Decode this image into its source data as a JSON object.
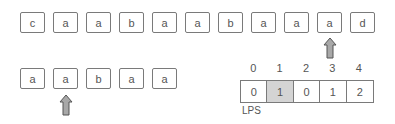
{
  "text": {
    "chars": [
      "c",
      "a",
      "a",
      "b",
      "a",
      "a",
      "b",
      "a",
      "a",
      "a",
      "d"
    ],
    "text_pointer_index": 9
  },
  "pattern": {
    "chars": [
      "a",
      "a",
      "b",
      "a",
      "a"
    ],
    "pattern_pointer_index": 1
  },
  "lps": {
    "indices": [
      "0",
      "1",
      "2",
      "3",
      "4"
    ],
    "values": [
      "0",
      "1",
      "0",
      "1",
      "2"
    ],
    "highlighted_index": 1,
    "label": "LPS"
  },
  "colors": {
    "border": "#7a7a7a",
    "highlight": "#d4d4d4",
    "arrow_fill": "#a8a8a8",
    "arrow_stroke": "#555555"
  }
}
